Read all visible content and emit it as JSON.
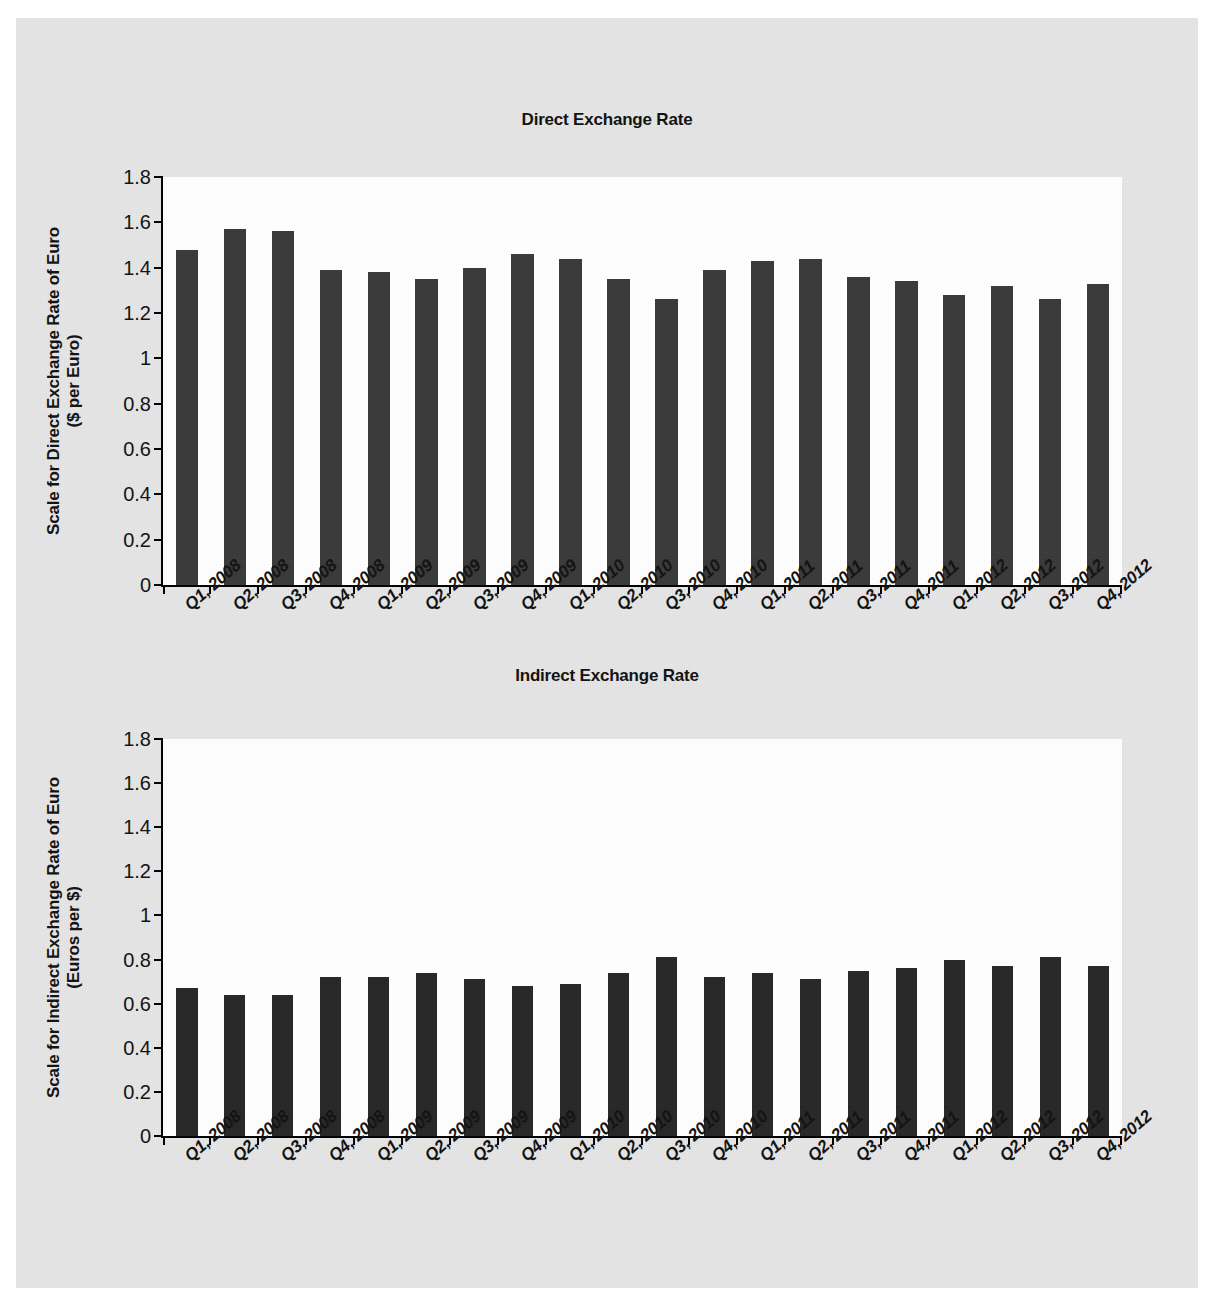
{
  "page": {
    "background_color": "#ffffff",
    "board_color": "#e6e6e6",
    "plot_background_color": "#ffffff",
    "clipped_header_text": " "
  },
  "chart_data": [
    {
      "type": "bar",
      "id": "direct-exchange-rate",
      "title": "Direct Exchange Rate",
      "xlabel": "",
      "ylabel": "Scale for Direct Exchange Rate of Euro ($ per Euro)",
      "ylabel_line1": "Scale for Direct Exchange Rate of Euro",
      "ylabel_line2": "($ per Euro)",
      "ylim": [
        0,
        1.8
      ],
      "ytick_labels": [
        "1.8",
        "1.6",
        "1.4",
        "1.2",
        "1",
        "0.8",
        "0.6",
        "0.4",
        "0.2",
        "0"
      ],
      "ytick_values": [
        1.8,
        1.6,
        1.4,
        1.2,
        1.0,
        0.8,
        0.6,
        0.4,
        0.2,
        0
      ],
      "grid": false,
      "legend": false,
      "bar_color": "#3a3a3a",
      "categories": [
        "Q1, 2008",
        "Q2, 2008",
        "Q3, 2008",
        "Q4, 2008",
        "Q1, 2009",
        "Q2, 2009",
        "Q3, 2009",
        "Q4, 2009",
        "Q1, 2010",
        "Q2, 2010",
        "Q3, 2010",
        "Q4, 2010",
        "Q1, 2011",
        "Q2, 2011",
        "Q3, 2011",
        "Q4, 2011",
        "Q1, 2012",
        "Q2, 2012",
        "Q3, 2012",
        "Q4, 2012"
      ],
      "values": [
        1.48,
        1.57,
        1.56,
        1.39,
        1.38,
        1.35,
        1.4,
        1.46,
        1.44,
        1.35,
        1.26,
        1.39,
        1.43,
        1.44,
        1.36,
        1.34,
        1.28,
        1.32,
        1.26,
        1.33
      ]
    },
    {
      "type": "bar",
      "id": "indirect-exchange-rate",
      "title": "Indirect Exchange Rate",
      "xlabel": "",
      "ylabel": "Scale for Indirect Exchange Rate of Euro (Euros per $)",
      "ylabel_line1": "Scale for Indirect Exchange Rate of Euro",
      "ylabel_line2": "(Euros per $)",
      "ylim": [
        0,
        1.8
      ],
      "ytick_labels": [
        "1.8",
        "1.6",
        "1.4",
        "1.2",
        "1",
        "0.8",
        "0.6",
        "0.4",
        "0.2",
        "0"
      ],
      "ytick_values": [
        1.8,
        1.6,
        1.4,
        1.2,
        1.0,
        0.8,
        0.6,
        0.4,
        0.2,
        0
      ],
      "grid": false,
      "legend": false,
      "bar_color": "#262626",
      "categories": [
        "Q1, 2008",
        "Q2, 2008",
        "Q3, 2008",
        "Q4, 2008",
        "Q1, 2009",
        "Q2, 2009",
        "Q3, 2009",
        "Q4, 2009",
        "Q1, 2010",
        "Q2, 2010",
        "Q3, 2010",
        "Q4, 2010",
        "Q1, 2011",
        "Q2, 2011",
        "Q3, 2011",
        "Q4, 2011",
        "Q1, 2012",
        "Q2, 2012",
        "Q3, 2012",
        "Q4, 2012"
      ],
      "values": [
        0.67,
        0.64,
        0.64,
        0.72,
        0.72,
        0.74,
        0.71,
        0.68,
        0.69,
        0.74,
        0.81,
        0.72,
        0.74,
        0.71,
        0.75,
        0.76,
        0.8,
        0.77,
        0.81,
        0.77
      ]
    }
  ]
}
